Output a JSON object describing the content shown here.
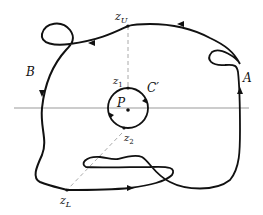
{
  "diagram": {
    "title": "",
    "labels": {
      "z_upper": "z",
      "z_upper_sub": "U",
      "z_lower": "z",
      "z_lower_sub": "L",
      "z1": "z",
      "z1_sub": "1",
      "z2": "z",
      "z2_sub": "2",
      "pole": "P",
      "small_circle": "C′",
      "arc_a": "A",
      "arc_b": "B"
    },
    "colors": {
      "stroke": "#111111",
      "axis": "#999999",
      "dashed": "#aaaaaa",
      "background": "#ffffff"
    }
  }
}
